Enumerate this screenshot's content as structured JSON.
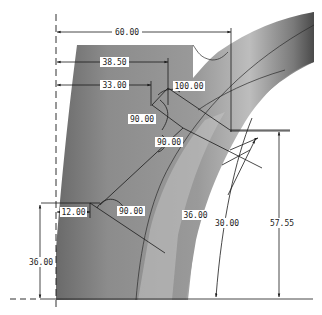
{
  "drawing": {
    "type": "CAD 2D dimensioned view of curved pipe/duct section",
    "colors": {
      "background": "#ffffff",
      "solid_light": "#b8b8b8",
      "solid_dark": "#555555",
      "dim_line": "#1a1a1a",
      "label_bg": "#ffffff"
    },
    "dimensions": [
      {
        "id": "d60",
        "label": "60.00",
        "kind": "linear-horizontal"
      },
      {
        "id": "d3850",
        "label": "38.50",
        "kind": "linear-horizontal"
      },
      {
        "id": "d3300",
        "label": "33.00",
        "kind": "linear-horizontal"
      },
      {
        "id": "d100",
        "label": "100.00",
        "kind": "angular"
      },
      {
        "id": "d90a",
        "label": "90.00",
        "kind": "angular"
      },
      {
        "id": "d90b",
        "label": "90.00",
        "kind": "angular"
      },
      {
        "id": "d12",
        "label": "12.00",
        "kind": "linear-horizontal"
      },
      {
        "id": "d90c",
        "label": "90.00",
        "kind": "angular"
      },
      {
        "id": "d36r",
        "label": "36.00",
        "kind": "linear-aligned"
      },
      {
        "id": "d30",
        "label": "30.00",
        "kind": "radial-vertical"
      },
      {
        "id": "d5755",
        "label": "57.55",
        "kind": "linear-vertical"
      },
      {
        "id": "d36v",
        "label": "36.00",
        "kind": "linear-vertical"
      }
    ]
  }
}
